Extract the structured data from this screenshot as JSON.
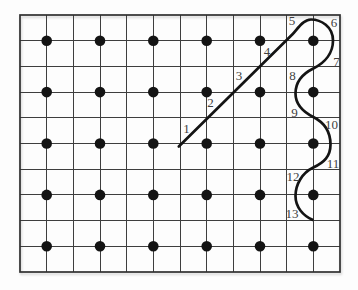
{
  "diagram": {
    "canvas": {
      "width": 358,
      "height": 290,
      "background": "#fdfdfd"
    },
    "grid": {
      "x": 20,
      "y": 15,
      "width": 320,
      "height": 257,
      "columns": 12,
      "rows": 10,
      "line_color": "#3e3e3e",
      "line_width": 1,
      "border_color": "#2f2f2f",
      "border_width": 1.7
    },
    "dots": {
      "columns_x": [
        46.7,
        100,
        153.3,
        206.7,
        260,
        313.3
      ],
      "rows_y": [
        40.7,
        92.1,
        143.5,
        194.9,
        246.3
      ],
      "radius": 5.3,
      "color": "#141414"
    },
    "curve": {
      "color": "#141414",
      "stroke_width": 2.7,
      "start_point": [
        178.8,
        146.5
      ],
      "end_point": [
        312.5,
        219.8
      ],
      "path": "M 178.8 146.5 L 292.5 34.2 C 297 29.8 302.5 19.5 311 19.5 C 321 19.5 333 26.5 333 40.5 C 333 52.5 325.5 62.5 313.3 68.5 C 301.5 74.3 295.5 82.5 295.5 93.5 C 295.5 104.5 302.5 111.5 313.3 117 C 324 122.4 330.5 132 330.5 144.5 C 330.5 156.5 324 162.4 313.3 167.5 C 302 172.9 295.5 184.5 295.5 196 C 295.5 207.5 303.5 215.8 312.5 219.8"
    },
    "labels": [
      {
        "text": "1",
        "x": 186.5,
        "y": 128.5
      },
      {
        "text": "2",
        "x": 210.5,
        "y": 102.5
      },
      {
        "text": "3",
        "x": 239.0,
        "y": 75.0
      },
      {
        "text": "4",
        "x": 267.0,
        "y": 51.0
      },
      {
        "text": "5",
        "x": 292.0,
        "y": 20.5
      },
      {
        "text": "6",
        "x": 334.0,
        "y": 22.0
      },
      {
        "text": "7",
        "x": 336.5,
        "y": 61.5
      },
      {
        "text": "8",
        "x": 292.5,
        "y": 75.0
      },
      {
        "text": "9",
        "x": 294.5,
        "y": 112.5
      },
      {
        "text": "10",
        "x": 331.5,
        "y": 124.5
      },
      {
        "text": "11",
        "x": 333.0,
        "y": 163.5
      },
      {
        "text": "12",
        "x": 293.0,
        "y": 176.5
      },
      {
        "text": "13",
        "x": 292.0,
        "y": 213.0
      }
    ],
    "label_style": {
      "color": "#3f3f3f",
      "font_size": 13
    }
  }
}
